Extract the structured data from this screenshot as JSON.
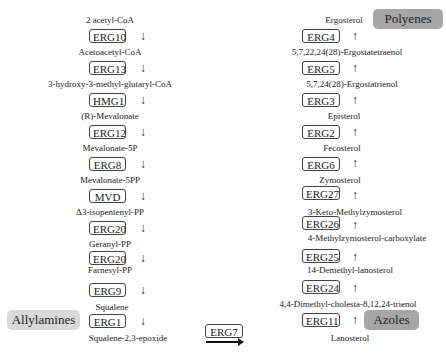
{
  "left_pathway": {
    "metabolites": [
      "2 acetyl-CoA",
      "Acetoacetyl-CoA",
      "3-hydroxy-3-methyl-glutaryl-CoA",
      "(R)-Mevalonate",
      "Mevalonate-5P",
      "Mevalonate-5PP",
      "Δ3-isopentenyl-PP",
      "Geranyl-PP",
      "Farnesyl-PP",
      "Squalene",
      "Squalene-2,3-epoxide"
    ],
    "enzymes": [
      "ERG10",
      "ERG13",
      "HMG1",
      "ERG12",
      "ERG8",
      "MVD",
      "ERG20",
      "ERG20",
      "ERG9",
      "ERG1"
    ],
    "arrow": "↓"
  },
  "right_pathway": {
    "metabolites": [
      "Ergosterol",
      "5,7,22,24(28)-Ergostatetraenol",
      "5,7,24(28)-Ergostatrienol",
      "Episterol",
      "Fecosterol",
      "Zymosterol",
      "3-Keto-Methylzymosterol",
      "4-Methylzymosterol-carboxylate",
      "14-Demethyl-lanosterol",
      "4,4-Dimethyl-cholesta-8,12,24-trienol",
      "Lanosterol"
    ],
    "enzymes": [
      "ERG4",
      "ERG5",
      "ERG3",
      "ERG2",
      "ERG6",
      "ERG27",
      "ERG26",
      "ERG25",
      "ERG24",
      "ERG11"
    ],
    "arrow": "↑"
  },
  "connector": {
    "enzyme": "ERG7"
  },
  "inhibitors": {
    "polyenes": {
      "label": "Polyenes",
      "color": "#a6a6a6"
    },
    "allylamines": {
      "label": "Allylamines",
      "color": "#d9d9d9"
    },
    "azoles": {
      "label": "Azoles",
      "color": "#a6a6a6"
    }
  }
}
